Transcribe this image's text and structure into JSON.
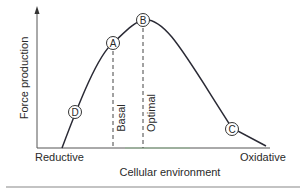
{
  "diagram": {
    "y_axis_label": "Force production",
    "x_axis_label": "Cellular environment",
    "x_left_label": "Reductive",
    "x_right_label": "Oxidative",
    "vertical_markers": [
      {
        "label": "Basal"
      },
      {
        "label": "Optimal"
      }
    ],
    "points": [
      {
        "label": "A"
      },
      {
        "label": "B"
      },
      {
        "label": "C"
      },
      {
        "label": "D"
      }
    ],
    "colors": {
      "line": "#2a2a35",
      "axis": "#555555",
      "text": "#2a2a2a",
      "rule": "#888888"
    }
  }
}
